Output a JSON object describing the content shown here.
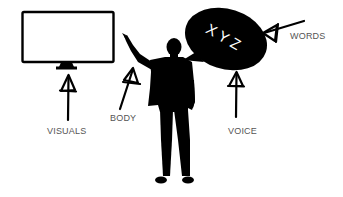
{
  "diagram": {
    "labels": {
      "visuals": "VISUALS",
      "body": "BODY",
      "voice": "VOICE",
      "words": "WORDS"
    },
    "speech_bubble": {
      "text": "XYZ"
    },
    "colors": {
      "ink": "#000000",
      "label": "#555555",
      "background": "#ffffff",
      "bubble_text": "#ffffff"
    },
    "elements": [
      "monitor-icon",
      "presenter-silhouette",
      "speech-bubble",
      "arrow-visuals",
      "arrow-body",
      "arrow-voice",
      "arrow-words"
    ]
  }
}
